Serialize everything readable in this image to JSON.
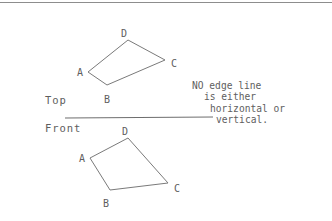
{
  "canvas": {
    "width": 332,
    "height": 221,
    "background": "#ffffff"
  },
  "style": {
    "line_color": "#7a7a7a",
    "text_color": "#5e5e5e",
    "divider_color": "#6e6e6e",
    "border_color": "#8d8d8d"
  },
  "views": {
    "top": {
      "label": "Top",
      "label_x": 45,
      "label_y": 94,
      "shape": {
        "name": "quadrilateral-abcd-top",
        "closed": true,
        "vertices": [
          {
            "id": "A",
            "x": 88,
            "y": 72,
            "label_x": 77,
            "label_y": 72
          },
          {
            "id": "B",
            "x": 107,
            "y": 85,
            "label_x": 104,
            "label_y": 99
          },
          {
            "id": "C",
            "x": 165,
            "y": 60,
            "label_x": 171,
            "label_y": 63
          },
          {
            "id": "D",
            "x": 128,
            "y": 40,
            "label_x": 121,
            "label_y": 33
          }
        ],
        "edges": [
          "A-B",
          "B-C",
          "C-D",
          "D-A"
        ]
      }
    },
    "front": {
      "label": "Front",
      "label_x": 45,
      "label_y": 122,
      "shape": {
        "name": "quadrilateral-abcd-front",
        "closed": true,
        "vertices": [
          {
            "id": "A",
            "x": 90,
            "y": 158,
            "label_x": 79,
            "label_y": 158
          },
          {
            "id": "B",
            "x": 110,
            "y": 190,
            "label_x": 103,
            "label_y": 203
          },
          {
            "id": "C",
            "x": 168,
            "y": 183,
            "label_x": 174,
            "label_y": 188
          },
          {
            "id": "D",
            "x": 128,
            "y": 138,
            "label_x": 122,
            "label_y": 131
          }
        ],
        "edges": [
          "A-B",
          "B-C",
          "C-D",
          "D-A"
        ]
      }
    }
  },
  "divider": {
    "x1": 65,
    "y1": 118,
    "x2": 213,
    "y2": 117
  },
  "annotation": {
    "lines": [
      "NO edge line",
      "is either",
      "horizontal or",
      "vertical."
    ],
    "full_text": "NO edge line is either horizontal or vertical."
  }
}
